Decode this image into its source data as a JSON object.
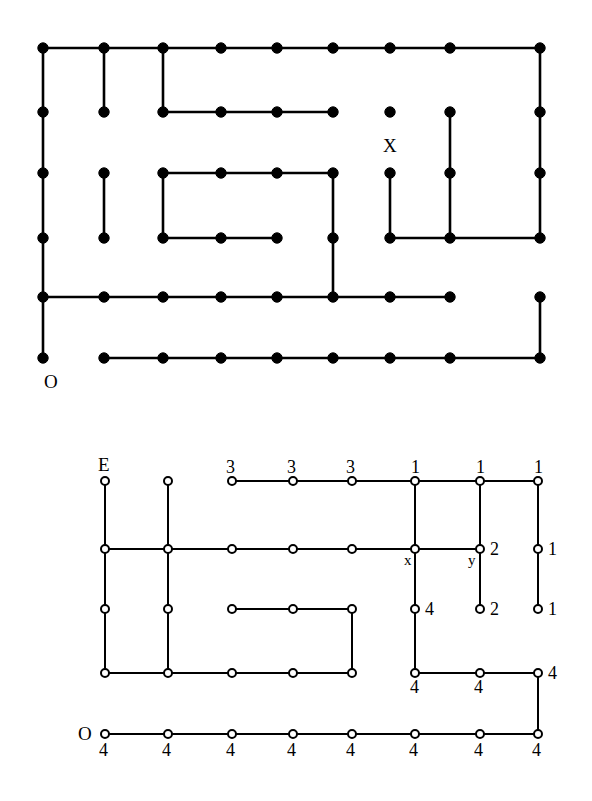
{
  "figure_top": {
    "name": "maze-graph-with-filled-nodes",
    "node_style": "filled-black-dot",
    "columns_x": [
      43,
      104,
      163,
      221,
      277,
      333,
      390,
      450,
      540
    ],
    "rows_y": [
      48,
      112,
      173,
      238,
      297,
      358
    ],
    "nodes": [
      {
        "id": "r1c1",
        "col": 1,
        "row": 1
      },
      {
        "id": "r1c2",
        "col": 2,
        "row": 1
      },
      {
        "id": "r1c3",
        "col": 3,
        "row": 1
      },
      {
        "id": "r1c4",
        "col": 4,
        "row": 1
      },
      {
        "id": "r1c5",
        "col": 5,
        "row": 1
      },
      {
        "id": "r1c6",
        "col": 6,
        "row": 1
      },
      {
        "id": "r1c7",
        "col": 7,
        "row": 1
      },
      {
        "id": "r1c8",
        "col": 8,
        "row": 1
      },
      {
        "id": "r1c9",
        "col": 9,
        "row": 1
      },
      {
        "id": "r2c1",
        "col": 1,
        "row": 2
      },
      {
        "id": "r2c2",
        "col": 2,
        "row": 2
      },
      {
        "id": "r2c3",
        "col": 3,
        "row": 2
      },
      {
        "id": "r2c4",
        "col": 4,
        "row": 2
      },
      {
        "id": "r2c5",
        "col": 5,
        "row": 2
      },
      {
        "id": "r2c6",
        "col": 6,
        "row": 2
      },
      {
        "id": "r2c7",
        "col": 7,
        "row": 2
      },
      {
        "id": "r2c8",
        "col": 8,
        "row": 2
      },
      {
        "id": "r2c9",
        "col": 9,
        "row": 2
      },
      {
        "id": "r3c1",
        "col": 1,
        "row": 3
      },
      {
        "id": "r3c2",
        "col": 2,
        "row": 3
      },
      {
        "id": "r3c3",
        "col": 3,
        "row": 3
      },
      {
        "id": "r3c4",
        "col": 4,
        "row": 3
      },
      {
        "id": "r3c5",
        "col": 5,
        "row": 3
      },
      {
        "id": "r3c6",
        "col": 6,
        "row": 3
      },
      {
        "id": "r3c7",
        "col": 7,
        "row": 3
      },
      {
        "id": "r3c8",
        "col": 8,
        "row": 3
      },
      {
        "id": "r3c9",
        "col": 9,
        "row": 3
      },
      {
        "id": "r4c1",
        "col": 1,
        "row": 4
      },
      {
        "id": "r4c2",
        "col": 2,
        "row": 4
      },
      {
        "id": "r4c3",
        "col": 3,
        "row": 4
      },
      {
        "id": "r4c4",
        "col": 4,
        "row": 4
      },
      {
        "id": "r4c5",
        "col": 5,
        "row": 4
      },
      {
        "id": "r4c6",
        "col": 6,
        "row": 4
      },
      {
        "id": "r4c7",
        "col": 7,
        "row": 4
      },
      {
        "id": "r4c8",
        "col": 8,
        "row": 4
      },
      {
        "id": "r4c9",
        "col": 9,
        "row": 4
      },
      {
        "id": "r5c1",
        "col": 1,
        "row": 5
      },
      {
        "id": "r5c2",
        "col": 2,
        "row": 5
      },
      {
        "id": "r5c3",
        "col": 3,
        "row": 5
      },
      {
        "id": "r5c4",
        "col": 4,
        "row": 5
      },
      {
        "id": "r5c5",
        "col": 5,
        "row": 5
      },
      {
        "id": "r5c6",
        "col": 6,
        "row": 5
      },
      {
        "id": "r5c7",
        "col": 7,
        "row": 5
      },
      {
        "id": "r5c8",
        "col": 8,
        "row": 5
      },
      {
        "id": "r5c9",
        "col": 9,
        "row": 5
      },
      {
        "id": "r6c1",
        "col": 1,
        "row": 6
      },
      {
        "id": "r6c2",
        "col": 2,
        "row": 6
      },
      {
        "id": "r6c3",
        "col": 3,
        "row": 6
      },
      {
        "id": "r6c4",
        "col": 4,
        "row": 6
      },
      {
        "id": "r6c5",
        "col": 5,
        "row": 6
      },
      {
        "id": "r6c6",
        "col": 6,
        "row": 6
      },
      {
        "id": "r6c7",
        "col": 7,
        "row": 6
      },
      {
        "id": "r6c8",
        "col": 8,
        "row": 6
      },
      {
        "id": "r6c9",
        "col": 9,
        "row": 6
      }
    ],
    "edges": [
      [
        1,
        1,
        2,
        1
      ],
      [
        2,
        1,
        3,
        1
      ],
      [
        3,
        1,
        4,
        1
      ],
      [
        4,
        1,
        5,
        1
      ],
      [
        5,
        1,
        6,
        1
      ],
      [
        6,
        1,
        7,
        1
      ],
      [
        7,
        1,
        8,
        1
      ],
      [
        8,
        1,
        9,
        1
      ],
      [
        1,
        1,
        1,
        2
      ],
      [
        2,
        1,
        2,
        2
      ],
      [
        3,
        1,
        3,
        2
      ],
      [
        9,
        1,
        9,
        2
      ],
      [
        3,
        2,
        4,
        2
      ],
      [
        4,
        2,
        5,
        2
      ],
      [
        5,
        2,
        6,
        2
      ],
      [
        1,
        2,
        1,
        3
      ],
      [
        8,
        2,
        8,
        3
      ],
      [
        9,
        2,
        9,
        3
      ],
      [
        3,
        3,
        4,
        3
      ],
      [
        4,
        3,
        5,
        3
      ],
      [
        5,
        3,
        6,
        3
      ],
      [
        1,
        3,
        1,
        4
      ],
      [
        2,
        3,
        2,
        4
      ],
      [
        3,
        3,
        3,
        4
      ],
      [
        6,
        3,
        6,
        4
      ],
      [
        7,
        3,
        7,
        4
      ],
      [
        8,
        3,
        8,
        4
      ],
      [
        9,
        3,
        9,
        4
      ],
      [
        3,
        4,
        4,
        4
      ],
      [
        4,
        4,
        5,
        4
      ],
      [
        7,
        4,
        8,
        4
      ],
      [
        8,
        4,
        9,
        4
      ],
      [
        1,
        4,
        1,
        5
      ],
      [
        6,
        4,
        6,
        5
      ],
      [
        1,
        5,
        2,
        5
      ],
      [
        2,
        5,
        3,
        5
      ],
      [
        3,
        5,
        4,
        5
      ],
      [
        4,
        5,
        5,
        5
      ],
      [
        5,
        5,
        6,
        5
      ],
      [
        6,
        5,
        7,
        5
      ],
      [
        7,
        5,
        8,
        5
      ],
      [
        1,
        5,
        1,
        6
      ],
      [
        9,
        5,
        9,
        6
      ],
      [
        2,
        6,
        3,
        6
      ],
      [
        3,
        6,
        4,
        6
      ],
      [
        4,
        6,
        5,
        6
      ],
      [
        5,
        6,
        6,
        6
      ],
      [
        6,
        6,
        7,
        6
      ],
      [
        7,
        6,
        8,
        6
      ],
      [
        8,
        6,
        9,
        6
      ]
    ],
    "annotations": [
      {
        "name": "label-X",
        "text": "X",
        "x": 383,
        "y": 136,
        "size": "big"
      },
      {
        "name": "label-O",
        "text": "O",
        "x": 44,
        "y": 372,
        "size": "big"
      }
    ]
  },
  "figure_bottom": {
    "name": "maze-graph-with-open-nodes-and-distance-labels",
    "node_style": "open-circle",
    "columns_x": [
      105,
      168,
      232,
      293,
      352,
      415,
      480,
      538
    ],
    "rows_y": [
      481,
      549,
      609,
      673,
      734
    ],
    "nodes": [
      {
        "id": "b1c1",
        "col": 1,
        "row": 1
      },
      {
        "id": "b1c2",
        "col": 2,
        "row": 1
      },
      {
        "id": "b1c3",
        "col": 3,
        "row": 1
      },
      {
        "id": "b1c4",
        "col": 4,
        "row": 1
      },
      {
        "id": "b1c5",
        "col": 5,
        "row": 1
      },
      {
        "id": "b1c6",
        "col": 6,
        "row": 1
      },
      {
        "id": "b1c7",
        "col": 7,
        "row": 1
      },
      {
        "id": "b1c8",
        "col": 8,
        "row": 1
      },
      {
        "id": "b2c1",
        "col": 1,
        "row": 2
      },
      {
        "id": "b2c2",
        "col": 2,
        "row": 2
      },
      {
        "id": "b2c3",
        "col": 3,
        "row": 2
      },
      {
        "id": "b2c4",
        "col": 4,
        "row": 2
      },
      {
        "id": "b2c5",
        "col": 5,
        "row": 2
      },
      {
        "id": "b2c6",
        "col": 6,
        "row": 2
      },
      {
        "id": "b2c7",
        "col": 7,
        "row": 2
      },
      {
        "id": "b2c8",
        "col": 8,
        "row": 2
      },
      {
        "id": "b3c1",
        "col": 1,
        "row": 3
      },
      {
        "id": "b3c2",
        "col": 2,
        "row": 3
      },
      {
        "id": "b3c3",
        "col": 3,
        "row": 3
      },
      {
        "id": "b3c4",
        "col": 4,
        "row": 3
      },
      {
        "id": "b3c5",
        "col": 5,
        "row": 3
      },
      {
        "id": "b3c6",
        "col": 6,
        "row": 3
      },
      {
        "id": "b3c7",
        "col": 7,
        "row": 3
      },
      {
        "id": "b3c8",
        "col": 8,
        "row": 3
      },
      {
        "id": "b4c1",
        "col": 1,
        "row": 4
      },
      {
        "id": "b4c2",
        "col": 2,
        "row": 4
      },
      {
        "id": "b4c3",
        "col": 3,
        "row": 4
      },
      {
        "id": "b4c4",
        "col": 4,
        "row": 4
      },
      {
        "id": "b4c5",
        "col": 5,
        "row": 4
      },
      {
        "id": "b4c6",
        "col": 6,
        "row": 4
      },
      {
        "id": "b4c7",
        "col": 7,
        "row": 4
      },
      {
        "id": "b4c8",
        "col": 8,
        "row": 4
      },
      {
        "id": "b5c1",
        "col": 1,
        "row": 5
      },
      {
        "id": "b5c2",
        "col": 2,
        "row": 5
      },
      {
        "id": "b5c3",
        "col": 3,
        "row": 5
      },
      {
        "id": "b5c4",
        "col": 4,
        "row": 5
      },
      {
        "id": "b5c5",
        "col": 5,
        "row": 5
      },
      {
        "id": "b5c6",
        "col": 6,
        "row": 5
      },
      {
        "id": "b5c7",
        "col": 7,
        "row": 5
      },
      {
        "id": "b5c8",
        "col": 8,
        "row": 5
      }
    ],
    "edges": [
      [
        3,
        1,
        4,
        1
      ],
      [
        4,
        1,
        5,
        1
      ],
      [
        5,
        1,
        6,
        1
      ],
      [
        6,
        1,
        7,
        1
      ],
      [
        7,
        1,
        8,
        1
      ],
      [
        1,
        1,
        1,
        2
      ],
      [
        2,
        1,
        2,
        2
      ],
      [
        6,
        1,
        6,
        2
      ],
      [
        7,
        1,
        7,
        2
      ],
      [
        8,
        1,
        8,
        2
      ],
      [
        1,
        2,
        2,
        2
      ],
      [
        2,
        2,
        3,
        2
      ],
      [
        3,
        2,
        4,
        2
      ],
      [
        4,
        2,
        5,
        2
      ],
      [
        5,
        2,
        6,
        2
      ],
      [
        6,
        2,
        7,
        2
      ],
      [
        1,
        2,
        1,
        3
      ],
      [
        2,
        2,
        2,
        3
      ],
      [
        6,
        2,
        6,
        3
      ],
      [
        7,
        2,
        7,
        3
      ],
      [
        8,
        2,
        8,
        3
      ],
      [
        3,
        3,
        4,
        3
      ],
      [
        4,
        3,
        5,
        3
      ],
      [
        1,
        3,
        1,
        4
      ],
      [
        2,
        3,
        2,
        4
      ],
      [
        5,
        3,
        5,
        4
      ],
      [
        6,
        3,
        6,
        4
      ],
      [
        1,
        4,
        2,
        4
      ],
      [
        2,
        4,
        3,
        4
      ],
      [
        3,
        4,
        4,
        4
      ],
      [
        4,
        4,
        5,
        4
      ],
      [
        6,
        4,
        7,
        4
      ],
      [
        7,
        4,
        8,
        4
      ],
      [
        8,
        4,
        8,
        5
      ],
      [
        1,
        5,
        2,
        5
      ],
      [
        2,
        5,
        3,
        5
      ],
      [
        3,
        5,
        4,
        5
      ],
      [
        4,
        5,
        5,
        5
      ],
      [
        5,
        5,
        6,
        5
      ],
      [
        6,
        5,
        7,
        5
      ],
      [
        7,
        5,
        8,
        5
      ]
    ],
    "node_labels": [
      {
        "name": "label-E",
        "text": "E",
        "x": 98,
        "y": 455,
        "size": "big"
      },
      {
        "name": "label-3-c3r1",
        "text": "3",
        "x": 226,
        "y": 458,
        "size": "num"
      },
      {
        "name": "label-3-c4r1",
        "text": "3",
        "x": 287,
        "y": 458,
        "size": "num"
      },
      {
        "name": "label-3-c5r1",
        "text": "3",
        "x": 346,
        "y": 458,
        "size": "num"
      },
      {
        "name": "label-1-c6r1",
        "text": "1",
        "x": 411,
        "y": 458,
        "size": "num"
      },
      {
        "name": "label-1-c7r1",
        "text": "1",
        "x": 476,
        "y": 458,
        "size": "num"
      },
      {
        "name": "label-1-c8r1",
        "text": "1",
        "x": 534,
        "y": 458,
        "size": "num"
      },
      {
        "name": "label-x-c6r2",
        "text": "x",
        "x": 404,
        "y": 553,
        "size": "small"
      },
      {
        "name": "label-y-c7r2",
        "text": "y",
        "x": 468,
        "y": 553,
        "size": "small"
      },
      {
        "name": "label-2-c7r2",
        "text": "2",
        "x": 490,
        "y": 540,
        "size": "num"
      },
      {
        "name": "label-1-c8r2",
        "text": "1",
        "x": 548,
        "y": 540,
        "size": "num"
      },
      {
        "name": "label-4-c6r3",
        "text": "4",
        "x": 425,
        "y": 600,
        "size": "num"
      },
      {
        "name": "label-2-c7r3",
        "text": "2",
        "x": 490,
        "y": 600,
        "size": "num"
      },
      {
        "name": "label-1-c8r3",
        "text": "1",
        "x": 548,
        "y": 600,
        "size": "num"
      },
      {
        "name": "label-4-c6r4",
        "text": "4",
        "x": 410,
        "y": 678,
        "size": "num"
      },
      {
        "name": "label-4-c7r4",
        "text": "4",
        "x": 474,
        "y": 678,
        "size": "num"
      },
      {
        "name": "label-4-c8r4",
        "text": "4",
        "x": 548,
        "y": 664,
        "size": "num"
      },
      {
        "name": "label-O",
        "text": "O",
        "x": 78,
        "y": 724,
        "size": "big"
      },
      {
        "name": "label-4-c1r5",
        "text": "4",
        "x": 99,
        "y": 741,
        "size": "num"
      },
      {
        "name": "label-4-c2r5",
        "text": "4",
        "x": 162,
        "y": 741,
        "size": "num"
      },
      {
        "name": "label-4-c3r5",
        "text": "4",
        "x": 226,
        "y": 741,
        "size": "num"
      },
      {
        "name": "label-4-c4r5",
        "text": "4",
        "x": 287,
        "y": 741,
        "size": "num"
      },
      {
        "name": "label-4-c5r5",
        "text": "4",
        "x": 346,
        "y": 741,
        "size": "num"
      },
      {
        "name": "label-4-c6r5",
        "text": "4",
        "x": 409,
        "y": 741,
        "size": "num"
      },
      {
        "name": "label-4-c7r5",
        "text": "4",
        "x": 474,
        "y": 741,
        "size": "num"
      },
      {
        "name": "label-4-c8r5",
        "text": "4",
        "x": 532,
        "y": 741,
        "size": "num"
      }
    ]
  },
  "style": {
    "ink": "#000000",
    "paper": "#ffffff",
    "line_width_top": 2.6,
    "line_width_bottom": 2.0,
    "dot_radius_top": 5.2,
    "circle_radius_bottom": 4.0
  }
}
